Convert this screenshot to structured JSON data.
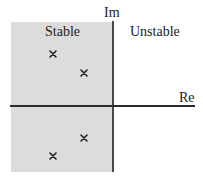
{
  "diagram": {
    "type": "s-plane pole plot",
    "axes": {
      "imaginary_label": "Im",
      "real_label": "Re"
    },
    "regions": {
      "left": {
        "label": "Stable",
        "fill": "#dcdcdc"
      },
      "right": {
        "label": "Unstable",
        "fill": "#ffffff"
      }
    },
    "poles": [
      {
        "marker": "x-icon",
        "x": 53,
        "y": 54
      },
      {
        "marker": "x-icon",
        "x": 84,
        "y": 73
      },
      {
        "marker": "x-icon",
        "x": 84,
        "y": 138
      },
      {
        "marker": "x-icon",
        "x": 53,
        "y": 156
      }
    ],
    "colors": {
      "axis": "#2a2a2a",
      "marker": "#222222",
      "text": "#222222"
    }
  }
}
